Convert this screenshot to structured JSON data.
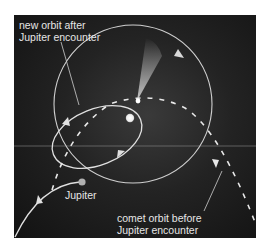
{
  "labels": {
    "new_orbit": {
      "line1": "new orbit after",
      "line2": "Jupiter encounter"
    },
    "old_orbit": {
      "line1": "comet orbit before",
      "line2": "Jupiter encounter"
    },
    "jupiter": "Jupiter"
  },
  "colors": {
    "background": "#ffffff",
    "panel": "#1c1c1c",
    "orbit_line": "#d8d8d8",
    "sun": "#f4f4f4",
    "jupiter": "#b0b0b0",
    "text": "#e6e6e6"
  }
}
